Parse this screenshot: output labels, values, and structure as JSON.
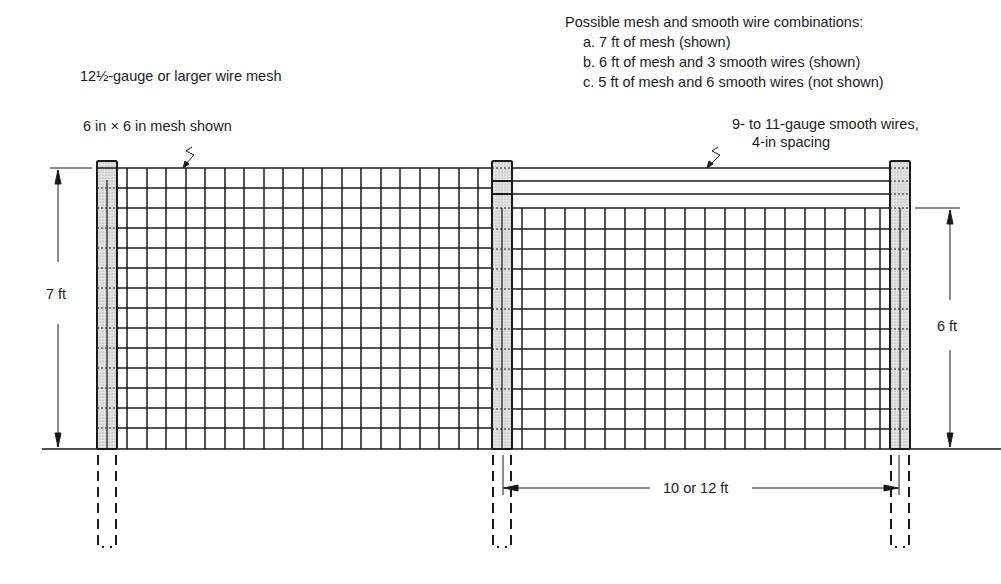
{
  "diagram": {
    "labels": {
      "mesh_gauge": "12½-gauge or larger wire mesh",
      "mesh_size": "6 in × 6 in mesh shown",
      "smooth_wire_line1": "9- to 11-gauge smooth wires,",
      "smooth_wire_line2": "4-in spacing",
      "left_height": "7 ft",
      "right_height": "6 ft",
      "post_spacing": "10 or 12 ft"
    },
    "combinations": {
      "heading": "Possible mesh and smooth wire combinations:",
      "items": [
        "a. 7 ft of mesh (shown)",
        "b. 6 ft of mesh and 3 smooth wires (shown)",
        "c. 5 ft of mesh and 6 smooth wires (not shown)"
      ]
    },
    "colors": {
      "line": "#1a1a1a",
      "post_fill": "#d4d4d4",
      "background": "#ffffff"
    }
  }
}
